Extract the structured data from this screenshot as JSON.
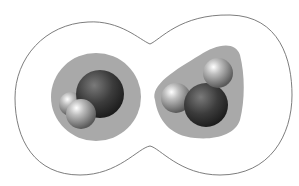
{
  "diagram": {
    "colors": {
      "background": "#ffffff",
      "contour": "#6e6e6e",
      "halo": "#a9a9a9",
      "oxygen": "#3a3a3a",
      "hydrogen": "#9a9a9a"
    },
    "molecules": [
      {
        "name": "water-left",
        "oxygen": {
          "cx": 98,
          "cy": 94,
          "r": 25
        },
        "hydrogens": [
          {
            "cx": 71,
            "cy": 104,
            "r": 12
          },
          {
            "cx": 81,
            "cy": 114,
            "r": 15
          }
        ],
        "halo": {
          "cx": 96,
          "cy": 97,
          "rx": 45,
          "ry": 44
        }
      },
      {
        "name": "water-right",
        "oxygen": {
          "cx": 206,
          "cy": 105,
          "r": 22
        },
        "hydrogens": [
          {
            "cx": 176,
            "cy": 98,
            "r": 15
          },
          {
            "cx": 217,
            "cy": 73,
            "r": 15
          }
        ]
      }
    ]
  }
}
